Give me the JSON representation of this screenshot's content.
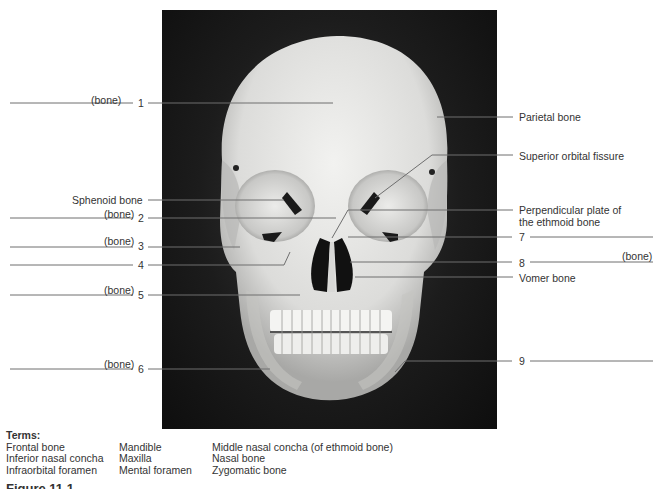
{
  "figure": {
    "photo_subject": "anterior view of human skull",
    "colors": {
      "background": "#ffffff",
      "photo_background": "#1a1a1a",
      "bone": "#e8e8e6",
      "leader_line": "#6e6e6e",
      "text": "#333333"
    },
    "left_labels": [
      {
        "number": "1",
        "blank_suffix": "(bone)"
      },
      {
        "text": "Sphenoid bone"
      },
      {
        "number": "2",
        "blank_suffix": "(bone)"
      },
      {
        "number": "3",
        "blank_suffix": "(bone)"
      },
      {
        "number": "4",
        "blank_suffix": ""
      },
      {
        "number": "5",
        "blank_suffix": "(bone)"
      },
      {
        "number": "6",
        "blank_suffix": "(bone)"
      }
    ],
    "right_labels": [
      {
        "text": "Parietal bone"
      },
      {
        "text": "Superior orbital fissure"
      },
      {
        "text_line1": "Perpendicular plate of",
        "text_line2": "the ethmoid bone"
      },
      {
        "number": "7",
        "blank_suffix": ""
      },
      {
        "number": "8",
        "blank_suffix": "(bone)"
      },
      {
        "text": "Vomer bone"
      },
      {
        "number": "9",
        "blank_suffix": ""
      }
    ]
  },
  "terms": {
    "title": "Terms:",
    "columns": [
      [
        "Frontal bone",
        "Inferior nasal concha",
        "Infraorbital foramen"
      ],
      [
        "Mandible",
        "Maxilla",
        "Mental foramen"
      ],
      [
        "Middle nasal concha (of ethmoid bone)",
        "Nasal bone",
        "Zygomatic bone"
      ]
    ]
  },
  "caption": {
    "partial_heading": "Figure 11.1"
  }
}
